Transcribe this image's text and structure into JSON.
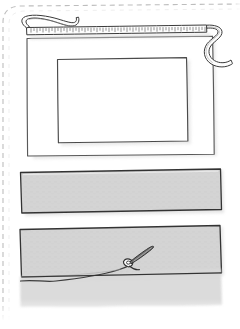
{
  "page": {
    "title": "Sewing step illustration",
    "width": 240,
    "height": 329,
    "background_color": "#ffffff",
    "border_style": "dashed",
    "border_color": "#b8b8b8",
    "border_edges": "top-and-left rounded corner"
  },
  "palette": {
    "ink": "#3a3a3a",
    "ink_light": "#5a5a5a",
    "fabric_fill": "#d4d4d4",
    "fabric_fill_light": "#dcdcdc",
    "paper_white": "#ffffff",
    "shadow": "#cfcfcf",
    "needle": "#6b6b6b",
    "dashed_border": "#b8b8b8"
  },
  "objects": [
    {
      "id": "measuring-tape",
      "label": "Measuring tape",
      "icon": "measuring-tape-icon",
      "description": "Flexible tape measure laid horizontally across the top with tick marks, looped at the left end and curling in an S at the right end",
      "tick_count": 58,
      "fill": "#ffffff",
      "stroke": "#3a3a3a"
    },
    {
      "id": "outer-frame",
      "label": "Outer fabric panel",
      "icon": "rectangle-outline-icon",
      "description": "Large hand drawn white rectangle with a soft drop shadow",
      "fill": "#ffffff",
      "stroke": "#5a5a5a"
    },
    {
      "id": "inner-frame",
      "label": "Inner marked opening",
      "icon": "rectangle-outline-icon",
      "description": "Smaller hand drawn rectangle nested inside the outer panel",
      "fill": "#ffffff",
      "stroke": "#5a5a5a"
    },
    {
      "id": "fabric-strip-top",
      "label": "Cut fabric strip",
      "icon": "fabric-strip-icon",
      "description": "Long grey filled strip of fabric with a dark outline",
      "fill": "#d4d4d4",
      "stroke": "#3a3a3a"
    },
    {
      "id": "fabric-strip-bottom",
      "label": "Folded fabric strip",
      "icon": "fabric-strip-icon",
      "description": "Second grey strip with the lower edge folded down showing a soft wavy hem",
      "fill": "#d4d4d4",
      "stroke": "#3a3a3a"
    },
    {
      "id": "needle-and-thread",
      "label": "Needle and thread",
      "icon": "needle-icon",
      "description": "Dark sewing needle with an eye, angled up to the right, stitching the fold with thread trailing to the left",
      "fill": "#6b6b6b",
      "stroke": "#3a3a3a"
    }
  ],
  "accessibility": {
    "alt_text": "Hand drawn craft diagram: a measuring tape above a rectangular panel with a marked inner rectangle, a cut grey fabric strip, and a second strip being hemmed with a needle and thread.",
    "caption": ""
  }
}
